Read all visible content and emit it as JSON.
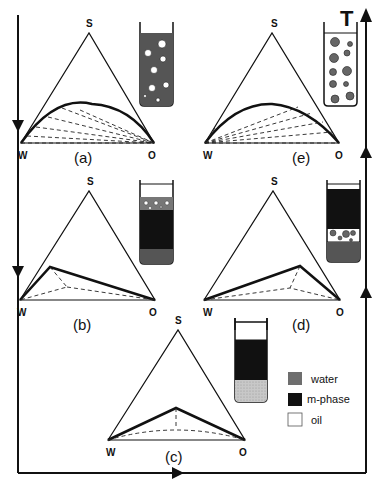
{
  "figure": {
    "axis_label": "T",
    "vertex_labels": {
      "top": "S",
      "left": "W",
      "right": "O"
    },
    "panels": [
      {
        "id": "a",
        "label": "(a)",
        "phase_type": "two-phase, lower lobe",
        "tube": "dark continuous phase with white droplets"
      },
      {
        "id": "b",
        "label": "(b)",
        "phase_type": "three-phase triangle, left",
        "tube": "white top, black middle, grey bottom with white droplets at interface"
      },
      {
        "id": "c",
        "label": "(c)",
        "phase_type": "three-phase triangle, center",
        "tube": "white top, black middle, light grey bottom"
      },
      {
        "id": "d",
        "label": "(d)",
        "phase_type": "three-phase triangle, right",
        "tube": "white top, black middle, grey bottom with grey droplets at interface"
      },
      {
        "id": "e",
        "label": "(e)",
        "phase_type": "two-phase, lower lobe",
        "tube": "white continuous phase with grey droplets"
      }
    ],
    "legend": [
      {
        "label": "water",
        "color": "#6e6e6e"
      },
      {
        "label": "m-phase",
        "color": "#111111"
      },
      {
        "label": "oil",
        "color": "#ffffff"
      }
    ]
  }
}
